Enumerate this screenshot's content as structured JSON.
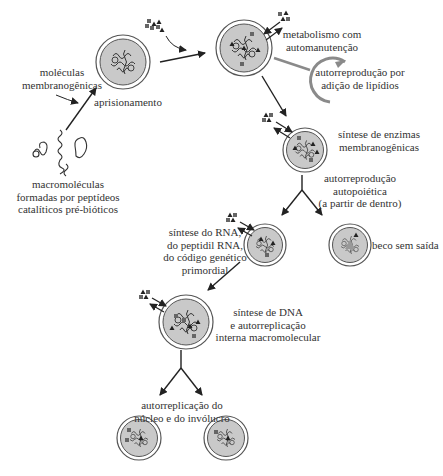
{
  "diagram": {
    "type": "flow",
    "colors": {
      "text": "#333333",
      "arrow": "#222222",
      "cell_fill": "#c9c9c9",
      "cell_ring": "#555555",
      "lipid_arrow": "#8a8a8a"
    },
    "labels": {
      "moleculas": [
        "moléculas",
        "membranogênicas"
      ],
      "aprisionamento": "aprisionamento",
      "macromoleculas": [
        "macromoléculas",
        "formadas por peptídeos",
        "catalíticos pré-bióticos"
      ],
      "metabolismo": [
        "metabolismo com",
        "automanutenção"
      ],
      "lipidios": [
        "autorreprodução por",
        "adição de lipídios"
      ],
      "enzimas": [
        "síntese de enzimas",
        "membranogênicas"
      ],
      "autopoietica": [
        "autorreprodução",
        "autopoiética",
        "(a partir de dentro)"
      ],
      "rna": [
        "síntese do RNA,",
        "do peptidil RNA,",
        "do código genético",
        "primordial"
      ],
      "beco": "beco sem saída",
      "dna": [
        "síntese de DNA",
        "e autorreplicação",
        "interna macromolecular"
      ],
      "nucleo": [
        "autorreplicação do",
        "núcleo e do invólucro"
      ]
    },
    "nodes": [
      {
        "id": "macromoleculas",
        "kind": "free-molecules"
      },
      {
        "id": "aprisionamento",
        "kind": "cell"
      },
      {
        "id": "metabolismo",
        "kind": "cell"
      },
      {
        "id": "enzimas",
        "kind": "cell"
      },
      {
        "id": "rna",
        "kind": "cell"
      },
      {
        "id": "beco",
        "kind": "cell"
      },
      {
        "id": "dna",
        "kind": "cell"
      },
      {
        "id": "nucleo-1",
        "kind": "cell"
      },
      {
        "id": "nucleo-2",
        "kind": "cell"
      }
    ]
  }
}
